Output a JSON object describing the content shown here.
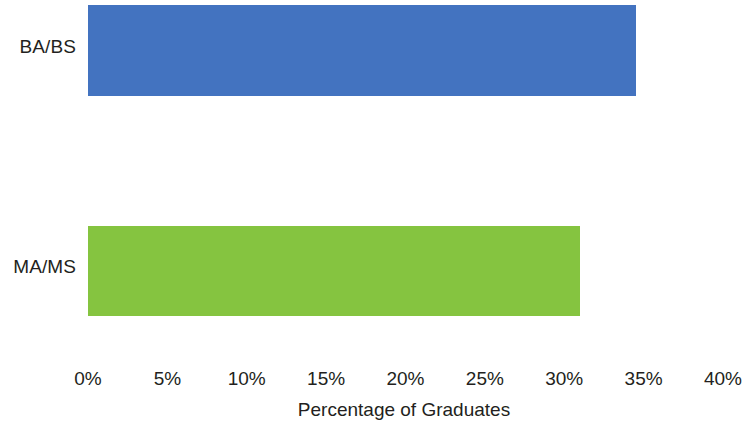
{
  "chart_data": {
    "type": "bar",
    "orientation": "horizontal",
    "title": "",
    "xlabel": "Percentage of Graduates",
    "ylabel": "",
    "categories": [
      "BA/BS",
      "MA/MS"
    ],
    "values": [
      34.5,
      31
    ],
    "value_unit": "%",
    "colors": [
      "#4373c0",
      "#85c440"
    ],
    "xlim": [
      0,
      40
    ],
    "xticks": [
      0,
      5,
      10,
      15,
      20,
      25,
      30,
      35,
      40
    ],
    "xtick_labels": [
      "0%",
      "5%",
      "10%",
      "15%",
      "20%",
      "25%",
      "30%",
      "35%",
      "40%"
    ],
    "grid": false,
    "legend": false,
    "background": "#ffffff",
    "series": [
      {
        "name": "Percentage of Graduates",
        "points": [
          {
            "category": "BA/BS",
            "value": 34.5,
            "color": "#4373c0"
          },
          {
            "category": "MA/MS",
            "value": 31,
            "color": "#85c440"
          }
        ]
      }
    ]
  },
  "axis": {
    "title": "Percentage of Graduates",
    "ticks": [
      {
        "label": "0%"
      },
      {
        "label": "5%"
      },
      {
        "label": "10%"
      },
      {
        "label": "15%"
      },
      {
        "label": "20%"
      },
      {
        "label": "25%"
      },
      {
        "label": "30%"
      },
      {
        "label": "35%"
      },
      {
        "label": "40%"
      }
    ]
  },
  "bars": [
    {
      "label": "BA/BS",
      "value": 34.5,
      "color": "#4373c0"
    },
    {
      "label": "MA/MS",
      "value": 31,
      "color": "#85c440"
    }
  ]
}
